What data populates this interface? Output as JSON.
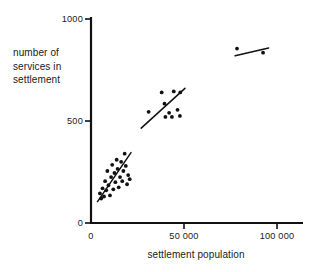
{
  "chart_data": {
    "type": "scatter",
    "title": "",
    "xlabel": "settlement population",
    "ylabel": "number of services in settlement",
    "ylabel_lines": [
      "number of",
      "services in",
      "settlement"
    ],
    "xlim": [
      0,
      115000
    ],
    "ylim": [
      0,
      1020
    ],
    "grid": false,
    "legend": null,
    "x_ticks": [
      {
        "value": 0,
        "label": "0"
      },
      {
        "value": 50000,
        "label": "50 000"
      },
      {
        "value": 100000,
        "label": "100 000"
      }
    ],
    "y_ticks": [
      {
        "value": 0,
        "label": "0"
      },
      {
        "value": 500,
        "label": "500"
      },
      {
        "value": 1000,
        "label": "1000"
      }
    ],
    "point_color": "#111111",
    "line_color": "#111111",
    "axis_color": "#111111",
    "series": [
      {
        "name": "small settlements",
        "points": [
          [
            4800,
            145
          ],
          [
            5500,
            120
          ],
          [
            6200,
            170
          ],
          [
            7000,
            130
          ],
          [
            7600,
            205
          ],
          [
            8200,
            160
          ],
          [
            8800,
            255
          ],
          [
            9400,
            185
          ],
          [
            10200,
            135
          ],
          [
            10800,
            225
          ],
          [
            11400,
            285
          ],
          [
            12000,
            165
          ],
          [
            12600,
            245
          ],
          [
            13100,
            200
          ],
          [
            13800,
            310
          ],
          [
            14300,
            265
          ],
          [
            14900,
            175
          ],
          [
            15600,
            225
          ],
          [
            16200,
            300
          ],
          [
            16800,
            205
          ],
          [
            17400,
            255
          ],
          [
            18100,
            340
          ],
          [
            18700,
            280
          ],
          [
            19400,
            190
          ],
          [
            20000,
            235
          ],
          [
            20800,
            215
          ]
        ],
        "trend_line": {
          "x1": 3500,
          "y1": 105,
          "x2": 21500,
          "y2": 345
        }
      },
      {
        "name": "medium settlements",
        "points": [
          [
            31000,
            545
          ],
          [
            38000,
            640
          ],
          [
            39500,
            585
          ],
          [
            40000,
            520
          ],
          [
            42000,
            540
          ],
          [
            43500,
            520
          ],
          [
            44500,
            645
          ],
          [
            46500,
            555
          ],
          [
            47800,
            525
          ],
          [
            48000,
            640
          ]
        ],
        "trend_line": {
          "x1": 27000,
          "y1": 465,
          "x2": 50500,
          "y2": 660
        }
      },
      {
        "name": "large settlements",
        "points": [
          [
            78500,
            855
          ],
          [
            92500,
            835
          ]
        ],
        "trend_line": {
          "x1": 77500,
          "y1": 820,
          "x2": 95500,
          "y2": 858
        }
      }
    ]
  }
}
